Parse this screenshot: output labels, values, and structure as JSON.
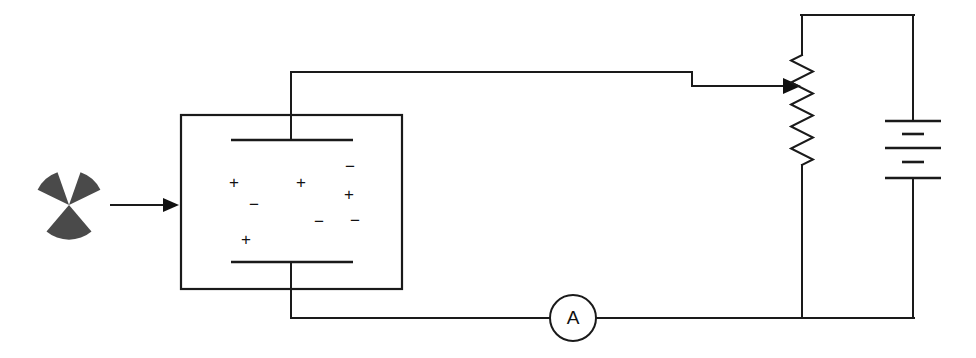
{
  "diagram": {
    "background_color": "#ffffff",
    "line_color": "#1a1a1a",
    "source_symbol_color": "#4a4a4a"
  },
  "radiation_source": {
    "icon_name": "radiation-trefoil-icon",
    "label": "",
    "center": {
      "x": 69,
      "y": 205
    },
    "blade_radius": 34
  },
  "incident_beam": {
    "icon_name": "beam-arrow-icon",
    "label": "",
    "from": {
      "x": 110,
      "y": 205
    },
    "to": {
      "x": 179,
      "y": 205
    }
  },
  "chamber": {
    "label": "",
    "box": {
      "x": 181,
      "y": 115,
      "width": 221,
      "height": 174
    },
    "top_plate": {
      "x1": 231,
      "x2": 353,
      "y": 140
    },
    "bottom_plate": {
      "x1": 231,
      "x2": 353,
      "y": 262
    },
    "top_lead": {
      "x": 291,
      "y1": 72,
      "y2": 140
    },
    "bottom_lead": {
      "x": 291,
      "y1": 262,
      "y2": 318
    },
    "charges": [
      {
        "sign": "+",
        "x": 234,
        "y": 184
      },
      {
        "sign": "−",
        "x": 254,
        "y": 206
      },
      {
        "sign": "+",
        "x": 301,
        "y": 184
      },
      {
        "sign": "−",
        "x": 319,
        "y": 223
      },
      {
        "sign": "−",
        "x": 350,
        "y": 168
      },
      {
        "sign": "+",
        "x": 349,
        "y": 196
      },
      {
        "sign": "−",
        "x": 355,
        "y": 222
      },
      {
        "sign": "+",
        "x": 246,
        "y": 241
      }
    ]
  },
  "top_wire": {
    "label": "",
    "points": "291,72 692,72 692,86 790,86"
  },
  "wiper_arrow": {
    "icon_name": "potentiometer-wiper-arrow-icon",
    "label": "",
    "tip": {
      "x": 800,
      "y": 86
    }
  },
  "resistor": {
    "name": "variable-resistor",
    "label": "",
    "x": 802,
    "y_top": 55,
    "y_bottom": 165,
    "zigzag_amplitude": 11,
    "zigzag_segments": 10,
    "lead_top": {
      "y1": 15,
      "y2": 55
    },
    "lead_bottom": {
      "y1": 165,
      "y2": 318
    }
  },
  "battery": {
    "name": "battery-cells",
    "label": "",
    "x": 913,
    "cells": 3,
    "long_plates": [
      {
        "y": 121,
        "half_width": 28
      },
      {
        "y": 148,
        "half_width": 28
      },
      {
        "y": 178,
        "half_width": 28
      }
    ],
    "short_plates": [
      {
        "y": 134,
        "half_width": 11
      },
      {
        "y": 162,
        "half_width": 11
      }
    ],
    "lead_top": {
      "y1": 15,
      "y2": 121
    },
    "lead_bottom": {
      "y1": 178,
      "y2": 318
    }
  },
  "loop_wires": {
    "top": "802,15 913,15",
    "bottom": "291,318 913,318"
  },
  "ammeter": {
    "name": "ammeter",
    "letter": "A",
    "center": {
      "x": 573,
      "y": 318
    },
    "radius": 23
  }
}
